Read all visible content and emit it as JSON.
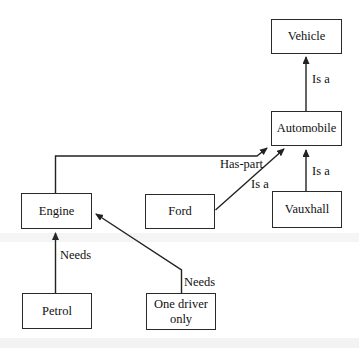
{
  "diagram": {
    "type": "semantic-network",
    "nodes": [
      {
        "id": "vehicle",
        "label": "Vehicle"
      },
      {
        "id": "automobile",
        "label": "Automobile"
      },
      {
        "id": "engine",
        "label": "Engine"
      },
      {
        "id": "ford",
        "label": "Ford"
      },
      {
        "id": "vauxhall",
        "label": "Vauxhall"
      },
      {
        "id": "petrol",
        "label": "Petrol"
      },
      {
        "id": "one_driver",
        "label": "One driver only"
      }
    ],
    "edges": [
      {
        "from": "Automobile",
        "to": "Vehicle",
        "label": "Is a"
      },
      {
        "from": "Engine",
        "to": "Automobile",
        "label": "Has-part"
      },
      {
        "from": "Ford",
        "to": "Automobile",
        "label": "Is a"
      },
      {
        "from": "Vauxhall",
        "to": "Automobile",
        "label": "Is a"
      },
      {
        "from": "Petrol",
        "to": "Engine",
        "label": "Needs"
      },
      {
        "from": "One driver only",
        "to": "Engine",
        "label": "Needs"
      }
    ],
    "colors": {
      "line": "#222222",
      "box_border": "#2a2a2a",
      "box_fill": "#ffffff",
      "background": "#ffffff",
      "text": "#111111"
    }
  }
}
